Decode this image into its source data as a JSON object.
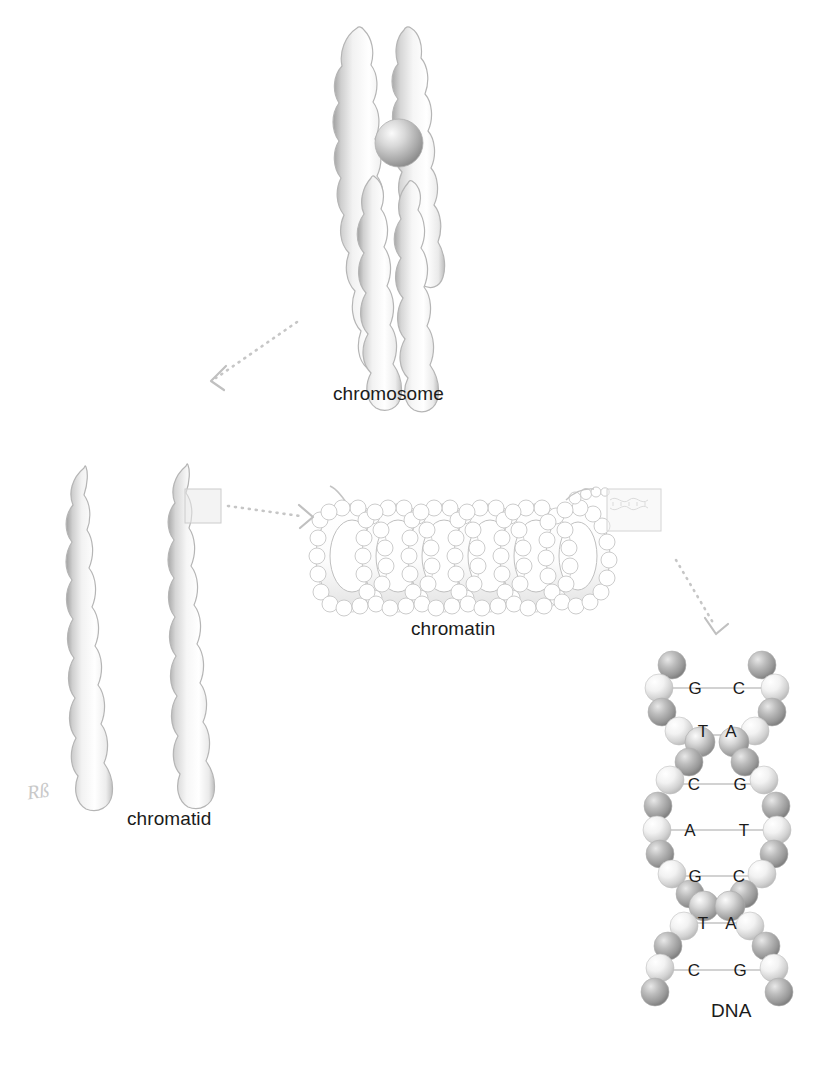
{
  "diagram": {
    "title_visible": false,
    "background_color": "#ffffff",
    "ink_color": "#1b1b1b",
    "line_color": "#b9b9b9",
    "arrow_color": "#bdbdbd",
    "stages": [
      {
        "id": "chromosome",
        "label": "chromosome",
        "label_x": 333,
        "label_y": 383
      },
      {
        "id": "chromatid",
        "label": "chromatid",
        "label_x": 127,
        "label_y": 808
      },
      {
        "id": "chromatin",
        "label": "chromatin",
        "label_x": 411,
        "label_y": 618
      },
      {
        "id": "dna",
        "label": "DNA",
        "label_x": 711,
        "label_y": 1000
      }
    ],
    "signature": {
      "text": "Rß",
      "x": 27,
      "y": 780
    },
    "arrows": [
      {
        "id": "chromosome-to-chromatid",
        "from": "chromosome",
        "to": "chromatid",
        "direction": "down-left"
      },
      {
        "id": "chromatid-to-chromatin",
        "from": "chromatid",
        "to": "chromatin",
        "direction": "right"
      },
      {
        "id": "chromatin-to-dna",
        "from": "chromatin",
        "to": "dna",
        "direction": "down-right"
      }
    ],
    "highlight_boxes": [
      {
        "id": "chromatid-zoom-box",
        "x": 185,
        "y": 489,
        "w": 36,
        "h": 34
      },
      {
        "id": "chromatin-zoom-box",
        "x": 607,
        "y": 489,
        "w": 54,
        "h": 42
      }
    ],
    "dna": {
      "base_pairs": [
        {
          "left": "G",
          "right": "C"
        },
        {
          "left": "T",
          "right": "A"
        },
        {
          "left": "C",
          "right": "G"
        },
        {
          "left": "A",
          "right": "T"
        },
        {
          "left": "G",
          "right": "C"
        },
        {
          "left": "T",
          "right": "A"
        },
        {
          "left": "C",
          "right": "G"
        }
      ],
      "base_label_color": "#1b1b1b"
    },
    "chromosome": {
      "centromere_label": "centromere",
      "arms": 4
    },
    "chromatin": {
      "loops": 6
    }
  }
}
